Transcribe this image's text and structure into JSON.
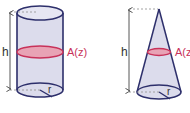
{
  "figures": [
    {
      "name": "cylinder",
      "height_label": "h",
      "cross_section_label": "A(z)",
      "radius_label": "r"
    },
    {
      "name": "cone",
      "height_label": "h",
      "cross_section_label": "A(z",
      "radius_label": "r"
    }
  ],
  "colors": {
    "outline": "#2d2f6b",
    "body_fill": "#dcdcec",
    "cross_section_fill": "#e8a3b5",
    "cross_section_stroke": "#c8325a",
    "label_pink": "#c8325a",
    "dashed": "#888888",
    "arrow": "#444444"
  }
}
